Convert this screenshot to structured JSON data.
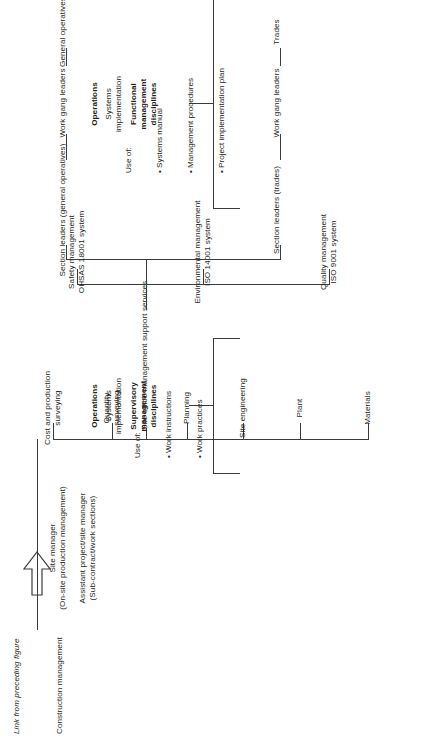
{
  "figure": {
    "link_note": "Link from preceding figure",
    "root": "Construction management",
    "nodes": {
      "site_manager_line1": "Site manager",
      "site_manager_line2": "(On-site production management)",
      "assistant_line1": "Assistant project/site manager",
      "assistant_line2": "(Sub-contract/work sections)",
      "support_services": "Site office management support services"
    },
    "production_branches": [
      "Materials",
      "Plant",
      "Site engineering",
      "Planning",
      "Quantity\nsurveying",
      "Cost and production\nsurveying"
    ],
    "support_branches": [
      "Quality management\nISO 9001 system",
      "Environmental management\nISO 14001 system",
      "Safety management\nOHSAS 18001 system"
    ],
    "supervisory": {
      "trades_chain": [
        "Section leaders (trades)",
        "Work gang leaders",
        "Trades"
      ],
      "general_chain": [
        "Section leaders (general operatives)",
        "Work gang leaders",
        "General operatives"
      ]
    },
    "callouts": [
      {
        "heading_1": "Operations",
        "heading_2": "Systems\nimplementation",
        "heading_3": "Functional\nmanagement\ndisciplines",
        "use_of_label": "Use of:",
        "use_of_items": [
          "Systems manual",
          "Management procedures",
          "Project implementation plan"
        ]
      },
      {
        "heading_1": "Operations",
        "heading_2": "Systems\nimplementation",
        "heading_3": "Supervisory\nmanagement\ndisciplines",
        "use_of_label": "Use of:",
        "use_of_items": [
          "Work instructions",
          "Work practices"
        ]
      }
    ]
  },
  "style": {
    "line_color": "#3b3b3b",
    "text_color": "#231f20",
    "background": "#ffffff"
  }
}
